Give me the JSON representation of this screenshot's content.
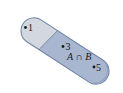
{
  "diagram": {
    "type": "venn-region",
    "colors": {
      "background": "#ffffff",
      "left_region_fill": "#d3d8de",
      "right_region_fill": "#a8b6cf",
      "outline": "#6d82a6",
      "point": "#1a1a1a"
    },
    "left_region": {
      "points": [
        {
          "label": "1"
        }
      ]
    },
    "right_region": {
      "label": "A ∩ B",
      "points": [
        {
          "label": "3"
        },
        {
          "label": "5"
        }
      ]
    }
  }
}
